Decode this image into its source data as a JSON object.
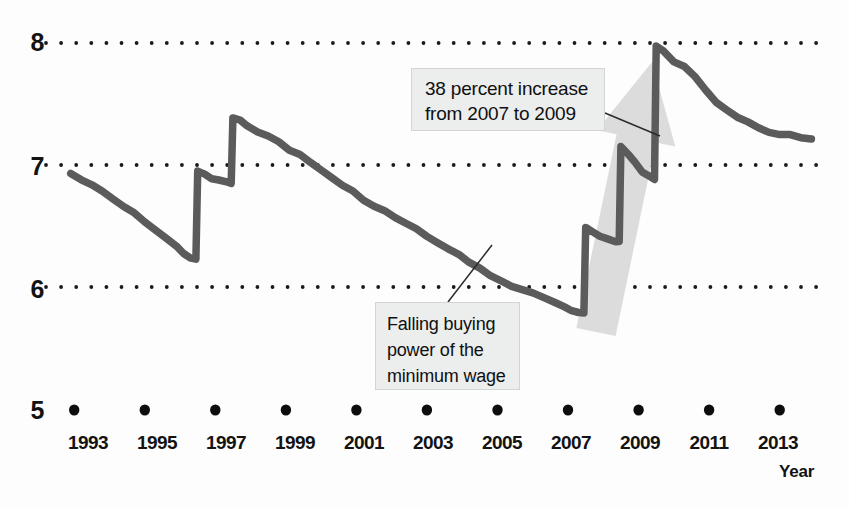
{
  "chart_data": {
    "type": "line",
    "title": "",
    "subtitle": "",
    "xlabel": "Year",
    "ylabel": "",
    "xlim": [
      1992.2,
      2014.2
    ],
    "ylim": [
      5,
      8
    ],
    "grid": true,
    "grid_style": "dotted-horizontal",
    "legend": "none",
    "y_ticks": [
      "8",
      "7",
      "6",
      "5"
    ],
    "y_tick_values": [
      8,
      7,
      6,
      5
    ],
    "x_ticks": [
      "1993",
      "1995",
      "1997",
      "1999",
      "2001",
      "2003",
      "2005",
      "2007",
      "2009",
      "2011",
      "2013"
    ],
    "x_tick_values": [
      1993,
      1995,
      1997,
      1999,
      2001,
      2003,
      2005,
      2007,
      2009,
      2011,
      2013
    ],
    "series": [
      {
        "name": "Real value of the federal minimum wage",
        "color": "#5b5b5b",
        "x": [
          1992.9,
          1993.2,
          1993.5,
          1993.8,
          1994.1,
          1994.4,
          1994.7,
          1995.0,
          1995.3,
          1995.6,
          1995.9,
          1996.1,
          1996.3,
          1996.45,
          1996.5,
          1996.7,
          1996.9,
          1997.1,
          1997.35,
          1997.45,
          1997.5,
          1997.7,
          1997.9,
          1998.2,
          1998.5,
          1998.8,
          1999.1,
          1999.4,
          1999.7,
          2000.0,
          2000.3,
          2000.6,
          2000.9,
          2001.2,
          2001.5,
          2001.8,
          2002.1,
          2002.4,
          2002.7,
          2003.0,
          2003.3,
          2003.6,
          2003.9,
          2004.2,
          2004.5,
          2004.8,
          2005.1,
          2005.4,
          2005.7,
          2006.0,
          2006.3,
          2006.6,
          2006.9,
          2007.1,
          2007.3,
          2007.45,
          2007.5,
          2007.7,
          2007.9,
          2008.1,
          2008.35,
          2008.45,
          2008.5,
          2008.7,
          2008.9,
          2009.1,
          2009.35,
          2009.45,
          2009.5,
          2009.7,
          2010.0,
          2010.3,
          2010.6,
          2010.9,
          2011.2,
          2011.5,
          2011.8,
          2012.1,
          2012.4,
          2012.7,
          2013.0,
          2013.3,
          2013.6,
          2013.9
        ],
        "y": [
          6.93,
          6.88,
          6.83,
          6.78,
          6.72,
          6.66,
          6.6,
          6.54,
          6.47,
          6.4,
          6.33,
          6.28,
          6.24,
          6.22,
          6.95,
          6.92,
          6.89,
          6.87,
          6.86,
          6.85,
          7.38,
          7.36,
          7.33,
          7.28,
          7.23,
          7.19,
          7.13,
          7.08,
          7.02,
          6.96,
          6.9,
          6.83,
          6.78,
          6.72,
          6.66,
          6.62,
          6.57,
          6.52,
          6.47,
          6.42,
          6.36,
          6.31,
          6.26,
          6.21,
          6.15,
          6.1,
          6.05,
          6.0,
          5.98,
          5.95,
          5.92,
          5.88,
          5.83,
          5.8,
          5.79,
          5.78,
          6.48,
          6.45,
          6.42,
          6.4,
          6.38,
          6.37,
          7.15,
          7.09,
          7.02,
          6.95,
          6.9,
          6.88,
          7.97,
          7.93,
          7.85,
          7.8,
          7.72,
          7.62,
          7.52,
          7.46,
          7.4,
          7.36,
          7.31,
          7.27,
          7.25,
          7.24,
          7.22,
          7.21
        ]
      }
    ],
    "annotations": [
      {
        "id": "increase",
        "lines": [
          "38 percent increase",
          "from 2007 to 2009"
        ],
        "leader_from": [
          605,
          113
        ],
        "leader_to": [
          660,
          136
        ]
      },
      {
        "id": "falling",
        "lines": [
          "Falling buying",
          "power of the",
          "minimum wage"
        ],
        "leader_from": [
          448,
          302
        ],
        "leader_to": [
          492,
          245
        ]
      }
    ],
    "arrow": {
      "name": "growth-arrow",
      "color": "#dcdcdc",
      "from": [
        596,
        332
      ],
      "to": [
        652,
        62
      ]
    }
  },
  "axes": {
    "y_labels": [
      {
        "text": "8",
        "top": 28
      },
      {
        "text": "7",
        "top": 152
      },
      {
        "text": "6",
        "top": 275
      },
      {
        "text": "5",
        "top": 396
      }
    ],
    "x_labels": [
      {
        "text": "1993",
        "left": 58
      },
      {
        "text": "1995",
        "left": 127
      },
      {
        "text": "1997",
        "left": 196
      },
      {
        "text": "1999",
        "left": 265
      },
      {
        "text": "2001",
        "left": 334
      },
      {
        "text": "2003",
        "left": 403
      },
      {
        "text": "2005",
        "left": 472
      },
      {
        "text": "2007",
        "left": 541
      },
      {
        "text": "2009",
        "left": 610
      },
      {
        "text": "2011",
        "left": 679
      },
      {
        "text": "2013",
        "left": 748
      }
    ],
    "x_axis_title": "Year"
  },
  "colors": {
    "line": "#5b5b5b",
    "grid_dot": "#1a1a1a",
    "tick_dot": "#0d0d0d",
    "arrow": "#dcdcdc",
    "callout_bg": "#eceded",
    "callout_border": "#d3d4d4",
    "text": "#131313"
  }
}
